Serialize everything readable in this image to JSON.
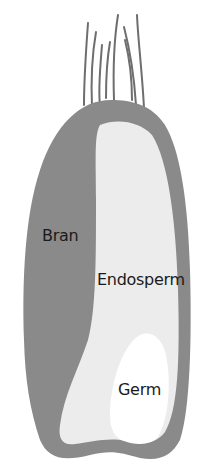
{
  "diagram": {
    "labels": {
      "bran": "Bran",
      "endosperm": "Endosperm",
      "germ": "Germ"
    },
    "colors": {
      "bran": "#8a8a8a",
      "endosperm": "#ececec",
      "germ": "#ffffff",
      "hairs": "#6e6e6e",
      "text": "#1a1a1a"
    }
  }
}
